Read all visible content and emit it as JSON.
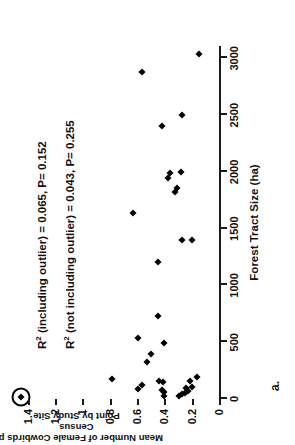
{
  "panel": {
    "label": "a."
  },
  "chart_data": {
    "type": "scatter",
    "title": "",
    "xlabel": "Forest Tract Size (ha)",
    "ylabel": "Mean Number of Female Cowbirds per Census Point by Study Site",
    "ylabel_lines": [
      "Mean Number of Female Cowbirds per Census",
      "Point by Study Site"
    ],
    "xlim": [
      0,
      3100
    ],
    "ylim": [
      0,
      1.5
    ],
    "xticks": [
      0,
      500,
      1000,
      1500,
      2000,
      2500,
      3000
    ],
    "xticklabels": [
      "0",
      "500",
      "1000",
      "1500",
      "2000",
      "2500",
      "3000"
    ],
    "yticks": [
      0,
      0.2,
      0.4,
      0.6,
      0.8,
      1,
      1.2,
      1.4
    ],
    "yticklabels": [
      "0",
      "0.2",
      "0.4",
      "0.6",
      "0.8",
      "1",
      "1.2",
      "1.4"
    ],
    "grid": false,
    "legend": false,
    "marker": "diamond",
    "marker_color": "#000000",
    "points": [
      {
        "x": 20,
        "y": 1.45,
        "outlier": true
      },
      {
        "x": 25,
        "y": 0.4
      },
      {
        "x": 30,
        "y": 0.29
      },
      {
        "x": 40,
        "y": 0.27
      },
      {
        "x": 55,
        "y": 0.25
      },
      {
        "x": 60,
        "y": 0.4
      },
      {
        "x": 70,
        "y": 0.23
      },
      {
        "x": 80,
        "y": 0.42
      },
      {
        "x": 85,
        "y": 0.59
      },
      {
        "x": 95,
        "y": 0.24
      },
      {
        "x": 110,
        "y": 0.2
      },
      {
        "x": 120,
        "y": 0.56
      },
      {
        "x": 150,
        "y": 0.41
      },
      {
        "x": 155,
        "y": 0.44
      },
      {
        "x": 160,
        "y": 0.21
      },
      {
        "x": 175,
        "y": 0.78
      },
      {
        "x": 190,
        "y": 0.16
      },
      {
        "x": 330,
        "y": 0.53
      },
      {
        "x": 400,
        "y": 0.5
      },
      {
        "x": 490,
        "y": 0.4
      },
      {
        "x": 540,
        "y": 0.59
      },
      {
        "x": 730,
        "y": 0.45
      },
      {
        "x": 1210,
        "y": 0.45
      },
      {
        "x": 1400,
        "y": 0.27
      },
      {
        "x": 1400,
        "y": 0.2
      },
      {
        "x": 1640,
        "y": 0.63
      },
      {
        "x": 1820,
        "y": 0.32
      },
      {
        "x": 1860,
        "y": 0.31
      },
      {
        "x": 1950,
        "y": 0.37
      },
      {
        "x": 1990,
        "y": 0.36
      },
      {
        "x": 2000,
        "y": 0.28
      },
      {
        "x": 2400,
        "y": 0.42
      },
      {
        "x": 2500,
        "y": 0.27
      },
      {
        "x": 2880,
        "y": 0.56
      },
      {
        "x": 3040,
        "y": 0.15
      }
    ],
    "annotations": [
      {
        "id": "r2-including-outlier",
        "text": "R² (including outlier) = 0.065, P= 0.152",
        "prefix": "R",
        "sup": "2",
        "rest": " (including outlier) = 0.065, P= 0.152",
        "r_squared": 0.065,
        "p_value": 0.152
      },
      {
        "id": "r2-not-including-outlier",
        "text": "R² (not including outlier) = 0.043, P= 0.255",
        "prefix": "R",
        "sup": "2",
        "rest": " (not including outlier) = 0.043, P= 0.255",
        "r_squared": 0.043,
        "p_value": 0.255
      }
    ]
  }
}
